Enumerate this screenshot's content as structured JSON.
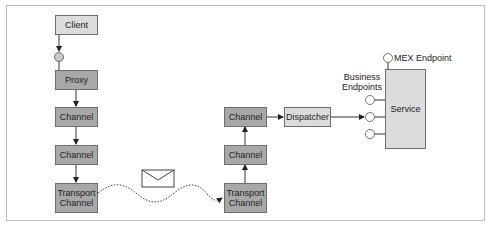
{
  "diagram": {
    "nodes": {
      "client": "Client",
      "proxy": "Proxy",
      "left_channel_1": "Channel",
      "left_channel_2": "Channel",
      "left_transport": "Transport Channel",
      "right_transport": "Transport Channel",
      "right_channel_1": "Channel",
      "right_channel_2": "Channel",
      "dispatcher": "Dispatcher",
      "service": "Service"
    },
    "labels": {
      "mex_endpoint": "MEX Endpoint",
      "business_endpoints": "Business Endpoints"
    },
    "edges": [
      {
        "from": "client",
        "to": "proxy",
        "via": "endpoint-circle"
      },
      {
        "from": "proxy",
        "to": "left_channel_1"
      },
      {
        "from": "left_channel_1",
        "to": "left_channel_2"
      },
      {
        "from": "left_channel_2",
        "to": "left_transport"
      },
      {
        "from": "left_transport",
        "to": "right_transport",
        "style": "dotted-wave",
        "carries": "message-envelope"
      },
      {
        "from": "right_transport",
        "to": "right_channel_2"
      },
      {
        "from": "right_channel_2",
        "to": "right_channel_1"
      },
      {
        "from": "right_channel_1",
        "to": "dispatcher"
      },
      {
        "from": "dispatcher",
        "to": "service",
        "via": "business-endpoint-2"
      }
    ],
    "colors": {
      "light_fill": "#dcdcdc",
      "dark_fill": "#a8a8a8",
      "stroke": "#6e6e6e",
      "frame": "#bdbdbd"
    }
  }
}
